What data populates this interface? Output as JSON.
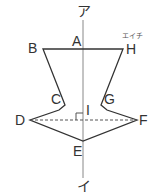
{
  "diagram": {
    "type": "line-symmetric-figure",
    "axis": {
      "top_label": "ア",
      "bottom_label": "イ"
    },
    "points": {
      "A": {
        "label": "A",
        "x": 83,
        "y": 49
      },
      "B": {
        "label": "B",
        "x": 43,
        "y": 49
      },
      "C": {
        "label": "C",
        "x": 65,
        "y": 105
      },
      "D": {
        "label": "D",
        "x": 30,
        "y": 120
      },
      "E": {
        "label": "E",
        "x": 83,
        "y": 141
      },
      "F": {
        "label": "F",
        "x": 137,
        "y": 120
      },
      "G": {
        "label": "G",
        "x": 101,
        "y": 105
      },
      "H": {
        "label": "H",
        "x": 123,
        "y": 49
      },
      "I": {
        "label": "I",
        "x": 83,
        "y": 120
      }
    },
    "h_reading": "エイチ",
    "colors": {
      "stroke": "#333333",
      "axis": "#888888"
    }
  }
}
